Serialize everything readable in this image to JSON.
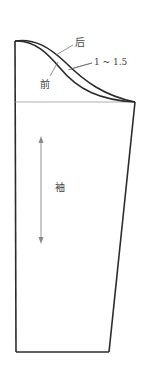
{
  "diagram": {
    "labels": {
      "back": "后",
      "front": "前",
      "offset": "1 ~ 1.5",
      "sleeve": "袖"
    },
    "colors": {
      "outline": "#2b2b2b",
      "guide": "#888888",
      "text": "#444444"
    }
  }
}
